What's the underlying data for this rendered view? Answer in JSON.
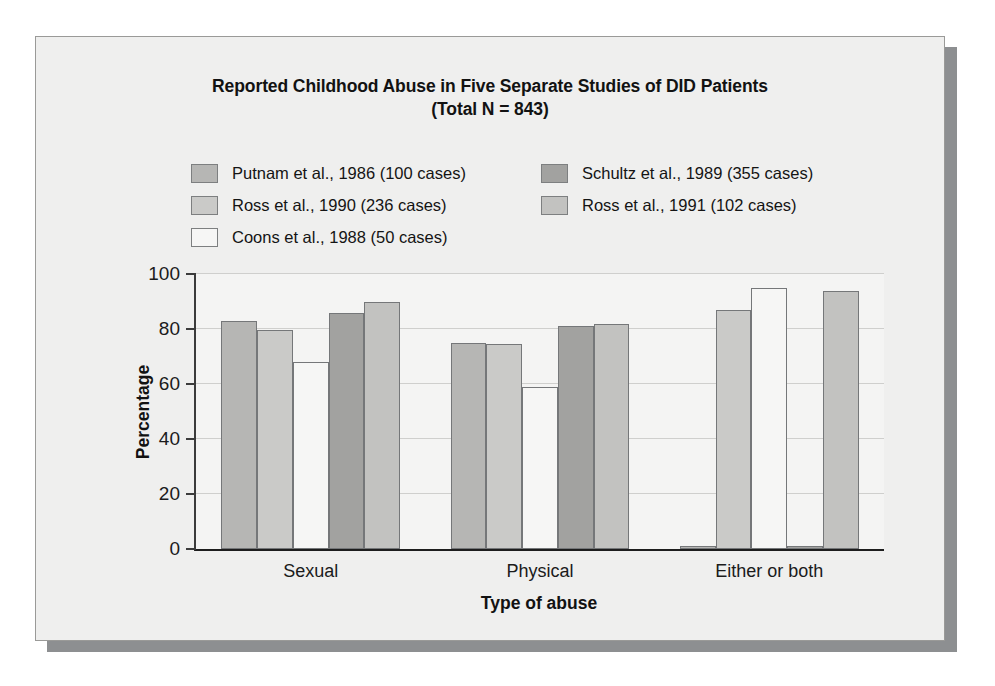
{
  "figure": {
    "title_line1": "Reported Childhood Abuse in Five Separate Studies of DID Patients",
    "title_line2": "(Total N = 843)"
  },
  "legend": {
    "left_column": [
      {
        "label": "Putnam et al., 1986 (100 cases)",
        "color": "#b6b6b4"
      },
      {
        "label": "Ross et al., 1990 (236 cases)",
        "color": "#cacac8"
      },
      {
        "label": "Coons et al., 1988 (50 cases)",
        "color": "#f6f6f5"
      }
    ],
    "right_column": [
      {
        "label": "Schultz et al., 1989 (355 cases)",
        "color": "#a2a2a0"
      },
      {
        "label": "Ross et al., 1991 (102 cases)",
        "color": "#c2c2c0"
      }
    ]
  },
  "axes": {
    "y_title": "Percentage",
    "x_title": "Type of abuse",
    "y_ticks": [
      0,
      20,
      40,
      60,
      80,
      100
    ]
  },
  "chart_data": {
    "type": "bar",
    "title": "Reported Childhood Abuse in Five Separate Studies of DID Patients (Total N = 843)",
    "xlabel": "Type of abuse",
    "ylabel": "Percentage",
    "ylim": [
      0,
      100
    ],
    "grid": true,
    "legend_position": "top",
    "categories": [
      "Sexual",
      "Physical",
      "Either or both"
    ],
    "series": [
      {
        "name": "Putnam et al., 1986 (100 cases)",
        "cases": 100,
        "color": "#b6b6b4",
        "values": [
          83,
          75,
          1
        ]
      },
      {
        "name": "Ross et al., 1990 (236 cases)",
        "cases": 236,
        "color": "#cacac8",
        "values": [
          79.5,
          74.5,
          87
        ]
      },
      {
        "name": "Coons et al., 1988 (50 cases)",
        "cases": 50,
        "color": "#f6f6f5",
        "values": [
          68,
          59,
          95
        ]
      },
      {
        "name": "Schultz et al., 1989 (355 cases)",
        "cases": 355,
        "color": "#a2a2a0",
        "values": [
          86,
          81,
          1
        ]
      },
      {
        "name": "Ross et al., 1991 (102 cases)",
        "cases": 102,
        "color": "#c2c2c0",
        "values": [
          90,
          82,
          94
        ]
      }
    ]
  }
}
